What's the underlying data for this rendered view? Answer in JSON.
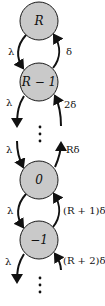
{
  "diagram": {
    "type": "birth-death chain",
    "node_fill": "#c9c9c9",
    "stroke_color": "#111111",
    "nodes": [
      {
        "id": "R",
        "label": "R"
      },
      {
        "id": "R-1",
        "label": "R − 1"
      },
      {
        "id": "0",
        "label": "0"
      },
      {
        "id": "-1",
        "label": "−1"
      }
    ],
    "ellipsis": "⋮",
    "rates": {
      "R_to_Rm1": "λ",
      "Rm1_to_R": "δ",
      "Rm1_down": "λ",
      "into_Rm1": "2δ",
      "into_0_down": "λ",
      "from_0_up": "Rδ",
      "0_to_m1": "λ",
      "m1_to_0": "(R + 1)δ",
      "m1_down": "λ",
      "into_m1": "(R + 2)δ"
    }
  }
}
